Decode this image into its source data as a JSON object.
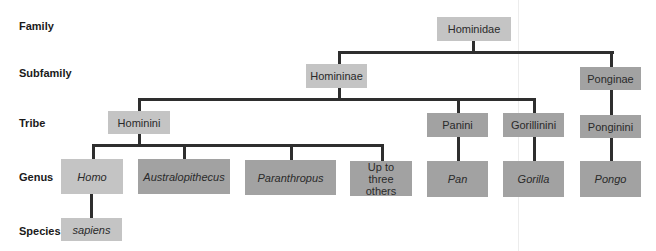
{
  "ranks": [
    "Family",
    "Subfamily",
    "Tribe",
    "Genus",
    "Species"
  ],
  "nodes": {
    "hominidae": "Hominidae",
    "homininae": "Homininae",
    "ponginae": "Ponginae",
    "hominini": "Hominini",
    "panini": "Panini",
    "gorillinini": "Gorillinini",
    "ponginini": "Ponginini",
    "homo": "Homo",
    "australopithecus": "Australopithecus",
    "paranthropus": "Paranthropus",
    "others": "Up to three others",
    "pan": "Pan",
    "gorilla": "Gorilla",
    "pongo": "Pongo",
    "sapiens": "sapiens"
  },
  "colors": {
    "human_lineage": "#c4c4c4",
    "other_lineage": "#a2a2a2",
    "connector": "#2e2e2e"
  }
}
